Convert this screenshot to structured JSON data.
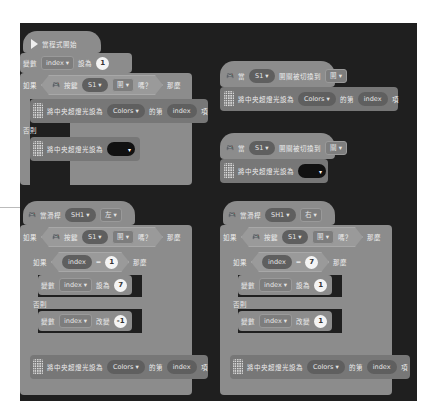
{
  "stack1": {
    "start_label": "當程式開始",
    "set_var": {
      "prefix": "變數",
      "var": "index",
      "mid": "設為",
      "value": "1"
    },
    "if_row": {
      "if": "如果",
      "key": "按鍵",
      "button": "S1",
      "state": "開",
      "q": "嗎？",
      "then": "那麼"
    },
    "led_row": {
      "text": "將中央超燈光設為",
      "list": "Colors",
      "of": "的第",
      "idx": "index",
      "item": "項"
    },
    "else": "否則",
    "led_color_row": {
      "text": "將中央超燈光設為"
    }
  },
  "stack2": {
    "when": "當",
    "button": "S1",
    "switch": "開關被切換到",
    "state": "開",
    "led_row": {
      "text": "將中央超燈光設為",
      "list": "Colors",
      "of": "的第",
      "idx": "index",
      "item": "項"
    }
  },
  "stack3": {
    "when": "當",
    "button": "S1",
    "switch": "開關被切換到",
    "state": "關",
    "led_color_row": {
      "text": "將中央超燈光設為"
    }
  },
  "stack4": {
    "hat": {
      "when": "當滑桿",
      "slider": "SH1",
      "dir": "左"
    },
    "if_row": {
      "if": "如果",
      "key": "按鍵",
      "button": "S1",
      "state": "開",
      "q": "嗎？",
      "then": "那麼"
    },
    "inner_if": {
      "if": "如果",
      "var": "index",
      "op": "=",
      "value": "1",
      "then": "那麼"
    },
    "set_var": {
      "prefix": "變數",
      "var": "index",
      "mid": "設為",
      "value": "7"
    },
    "else": "否則",
    "change_var": {
      "prefix": "變數",
      "var": "index",
      "mid": "改變",
      "value": "-1"
    },
    "led_row": {
      "text": "將中央超燈光設為",
      "list": "Colors",
      "of": "的第",
      "idx": "index",
      "item": "項"
    }
  },
  "stack5": {
    "hat": {
      "when": "當滑桿",
      "slider": "SH1",
      "dir": "右"
    },
    "if_row": {
      "if": "如果",
      "key": "按鍵",
      "button": "S1",
      "state": "開",
      "q": "嗎？",
      "then": "那麼"
    },
    "inner_if": {
      "if": "如果",
      "var": "index",
      "op": "=",
      "value": "7",
      "then": "那麼"
    },
    "set_var": {
      "prefix": "變數",
      "var": "index",
      "mid": "設為",
      "value": "1"
    },
    "else": "否則",
    "change_var": {
      "prefix": "變數",
      "var": "index",
      "mid": "改變",
      "value": "1"
    },
    "led_row": {
      "text": "將中央超燈光設為",
      "list": "Colors",
      "of": "的第",
      "idx": "index",
      "item": "項"
    }
  },
  "icons": {
    "dropdown": "▾"
  }
}
